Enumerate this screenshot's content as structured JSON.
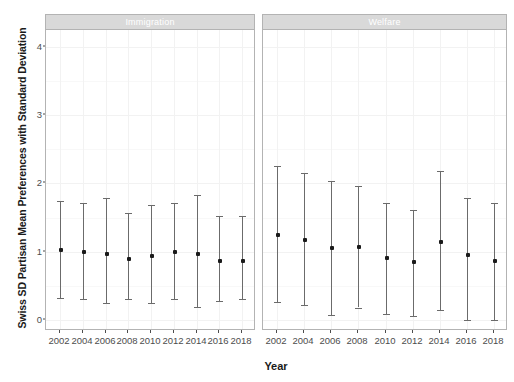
{
  "chart_data": {
    "type": "scatter",
    "title": "",
    "xlabel": "Year",
    "ylabel": "Swiss SD Partisan Mean Preferences with Standard Deviation",
    "x": [
      2002,
      2004,
      2006,
      2008,
      2010,
      2012,
      2014,
      2016,
      2018
    ],
    "xtick_labels": [
      "2002",
      "2004",
      "2006",
      "2008",
      "2010",
      "2012",
      "2014",
      "2016",
      "2018"
    ],
    "ytick_labels": [
      "0",
      "1",
      "2",
      "3",
      "4"
    ],
    "yticks": [
      0,
      1,
      2,
      3,
      4
    ],
    "ylim": [
      -0.15,
      4.25
    ],
    "grid": true,
    "legend": false,
    "marker": "filled-square",
    "errorbar_style": "capped-vertical",
    "panels": [
      {
        "label": "Immigration",
        "series": [
          {
            "name": "Immigration",
            "mean": [
              1.03,
              1.0,
              0.97,
              0.89,
              0.93,
              1.0,
              0.97,
              0.86,
              0.86
            ],
            "lower": [
              0.32,
              0.3,
              0.25,
              0.3,
              0.24,
              0.31,
              0.19,
              0.27,
              0.31
            ],
            "upper": [
              1.74,
              1.72,
              1.78,
              1.56,
              1.68,
              1.72,
              1.83,
              1.52,
              1.52
            ]
          }
        ]
      },
      {
        "label": "Welfare",
        "series": [
          {
            "name": "Welfare",
            "mean": [
              1.24,
              1.17,
              1.06,
              1.07,
              0.9,
              0.85,
              1.14,
              0.95,
              0.86
            ],
            "lower": [
              0.26,
              0.22,
              0.07,
              0.18,
              0.08,
              0.06,
              0.15,
              0.0,
              0.0
            ],
            "upper": [
              2.26,
              2.16,
              2.04,
              1.96,
              1.71,
              1.61,
              2.18,
              1.78,
              1.71
            ]
          }
        ]
      }
    ],
    "colors": {
      "point": "#1a1a1a",
      "errorbar": "#6b6b6b",
      "panel_strip_bg": "#d9d9d9",
      "panel_strip_text": "#ffffff",
      "grid_major": "#f2f2f2",
      "grid_minor": "#f8f8f8",
      "axis_text": "#4d4d4d",
      "panel_border": "#b3b3b3",
      "background": "#ffffff"
    }
  }
}
